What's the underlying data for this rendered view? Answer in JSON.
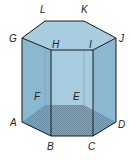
{
  "figure": {
    "type": "hexagonal prism",
    "colors": {
      "top_face": "#a9cde0",
      "side_face_left": "#7eaecb",
      "side_face_front": "#9ac3da",
      "side_face_right": "#7eaecb",
      "back_faces": "#b5d4e4",
      "edge": "#1a1a1a",
      "hidden_edge": "#5e8fae",
      "base_pattern": "#3d4f5c"
    },
    "vertices": {
      "top": [
        "G",
        "H",
        "I",
        "J",
        "K",
        "L"
      ],
      "bottom": [
        "A",
        "B",
        "C",
        "D",
        "E",
        "F"
      ]
    },
    "labels": {
      "L": "L",
      "K": "K",
      "G": "G",
      "J": "J",
      "H": "H",
      "I": "I",
      "F": "F",
      "E": "E",
      "A": "A",
      "D": "D",
      "B": "B",
      "C": "C"
    }
  }
}
